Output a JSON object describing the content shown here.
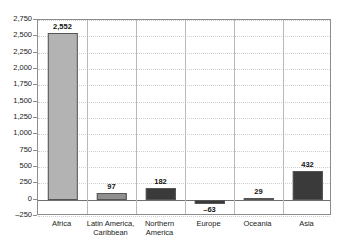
{
  "chart_data": {
    "type": "bar",
    "title": "",
    "subtitle": "",
    "xlabel": "",
    "ylabel": "",
    "categories": [
      "Africa",
      "Latin America,\nCaribbean",
      "Northern\nAmerica",
      "Europe",
      "Oceania",
      "Asia"
    ],
    "values": [
      2552,
      97,
      182,
      -63,
      29,
      432
    ],
    "value_labels": [
      "2,552",
      "97",
      "182",
      "–63",
      "29",
      "432"
    ],
    "bar_colors": [
      "#b3b3b3",
      "#8f8f8f",
      "#3a3a3a",
      "#3a3a3a",
      "#3a3a3a",
      "#3a3a3a"
    ],
    "ylim": [
      -250,
      2750
    ],
    "ytick_values": [
      2750,
      2500,
      2250,
      2000,
      1750,
      1500,
      1250,
      1000,
      750,
      500,
      250,
      0,
      -250
    ],
    "ytick_labels": [
      "2,750",
      "2,500",
      "2,250",
      "2,000",
      "1,750",
      "1,500",
      "1,250",
      "1,000",
      "750",
      "500",
      "250",
      "0",
      "–250"
    ],
    "grid": {
      "horizontal": true,
      "horizontal_style": "dotted",
      "vertical_separators": true,
      "zero_line": true
    },
    "legend": {
      "visible": false,
      "entries": []
    },
    "colors": {
      "plot_border": "#8c8c8c",
      "gridline": "#cfcfcf",
      "separator": "#b9b9b9",
      "zero_line": "#6f6f6f",
      "bar_light": "#b3b3b3",
      "bar_medium": "#8f8f8f",
      "bar_dark": "#3a3a3a",
      "text": "#1a1a1a",
      "background": "#ffffff"
    }
  }
}
